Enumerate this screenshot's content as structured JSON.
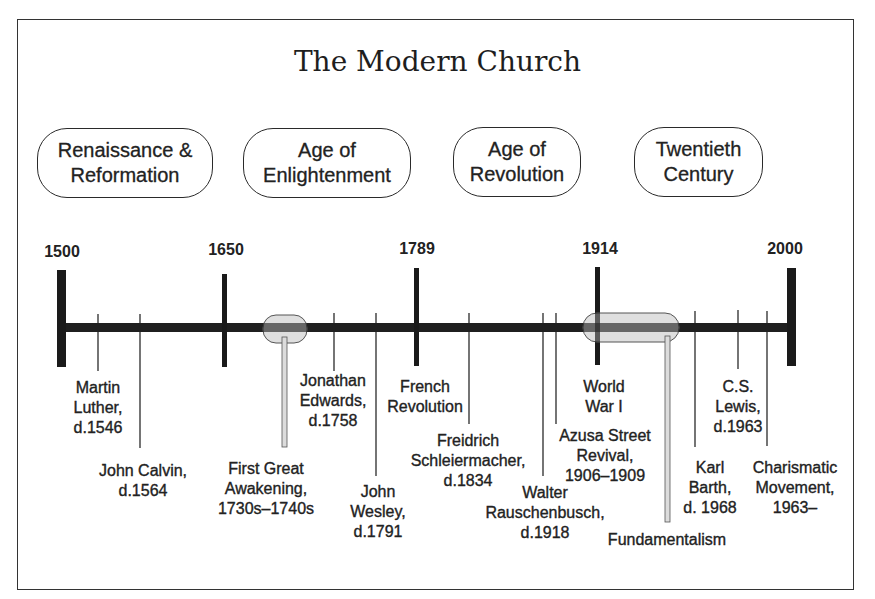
{
  "title": "The Modern Church",
  "eras": [
    {
      "label": "Renaissance &\nReformation"
    },
    {
      "label": "Age of\nEnlightenment"
    },
    {
      "label": "Age of\nRevolution"
    },
    {
      "label": "Twentieth\nCentury"
    }
  ],
  "years": [
    "1500",
    "1650",
    "1789",
    "1914",
    "2000"
  ],
  "events": [
    {
      "label": "Martin\nLuther,\nd.1546"
    },
    {
      "label": "John Calvin,\nd.1564"
    },
    {
      "label": "First Great\nAwakening,\n1730s–1740s"
    },
    {
      "label": "Jonathan\nEdwards,\nd.1758"
    },
    {
      "label": "John\nWesley,\nd.1791"
    },
    {
      "label": "French\nRevolution"
    },
    {
      "label": "Freidrich\nSchleiermacher,\nd.1834"
    },
    {
      "label": "Walter\nRauschenbusch,\nd.1918"
    },
    {
      "label": "Azusa Street\nRevival,\n1906–1909"
    },
    {
      "label": "World\nWar I"
    },
    {
      "label": "Fundamentalism"
    },
    {
      "label": "Karl\nBarth,\nd. 1968"
    },
    {
      "label": "C.S.\nLewis,\nd.1963"
    },
    {
      "label": "Charismatic\nMovement,\n1963–"
    }
  ],
  "colors": {
    "line": "#1f1f1f",
    "span_fill": "#d9d9d9",
    "span_stroke": "#555555",
    "text": "#222222"
  }
}
